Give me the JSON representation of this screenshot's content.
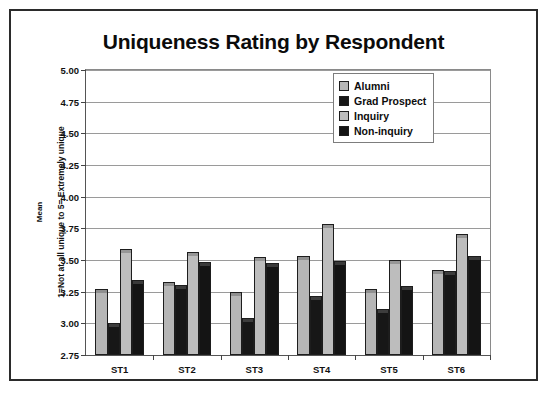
{
  "chart_data": {
    "type": "bar",
    "title": "Uniqueness Rating by Respondent",
    "xlabel": "",
    "ylabel": "Mean",
    "ylabel_secondary": "1=Not at all unique to 5= Extremely unique",
    "ylim": [
      2.75,
      5.0
    ],
    "ytick_step": 0.25,
    "ytick_labels": [
      "5.00",
      "4.75",
      "4.50",
      "4.25",
      "4.00",
      "3.75",
      "3.50",
      "3.25",
      "3.00",
      "2.75"
    ],
    "ytick_values": [
      5.0,
      4.75,
      4.5,
      4.25,
      4.0,
      3.75,
      3.5,
      3.25,
      3.0,
      2.75
    ],
    "grid": true,
    "legend_position": "upper right",
    "categories": [
      "ST1",
      "ST2",
      "ST3",
      "ST4",
      "ST5",
      "ST6"
    ],
    "series": [
      {
        "name": "Alumni",
        "color": "#b6b6b6",
        "values": [
          3.25,
          3.3,
          3.22,
          3.51,
          3.25,
          3.4
        ]
      },
      {
        "name": "Grad Prospect",
        "color": "#171717",
        "values": [
          2.98,
          3.28,
          3.02,
          3.19,
          3.09,
          3.39
        ]
      },
      {
        "name": "Inquiry",
        "color": "#bdbdbd",
        "values": [
          3.56,
          3.54,
          3.5,
          3.76,
          3.48,
          3.68
        ]
      },
      {
        "name": "Non-inquiry",
        "color": "#141414",
        "values": [
          3.32,
          3.46,
          3.45,
          3.47,
          3.27,
          3.51
        ]
      }
    ]
  },
  "legend": {
    "items": [
      {
        "label": "Alumni"
      },
      {
        "label": "Grad Prospect"
      },
      {
        "label": "Inquiry"
      },
      {
        "label": "Non-inquiry"
      }
    ]
  }
}
